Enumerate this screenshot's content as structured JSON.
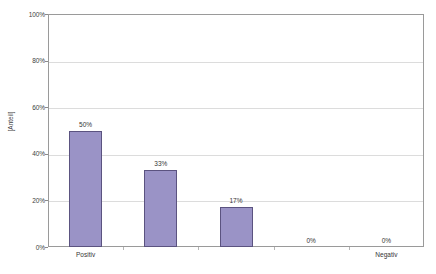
{
  "chart_data": {
    "type": "bar",
    "title": "",
    "subtitle": "",
    "xlabel": "",
    "ylabel": "[Anteil]",
    "ylim": [
      0,
      100
    ],
    "grid": true,
    "legend": false,
    "legend_position": "none",
    "categories": [
      "Positiv",
      "",
      "",
      "",
      "Negativ"
    ],
    "x_tick_labels": [
      "Positiv",
      "Negativ"
    ],
    "values": [
      50,
      33,
      17,
      0,
      0
    ],
    "data_labels": [
      "50%",
      "33%",
      "17%",
      "0%",
      "0%"
    ],
    "y_tick_labels": [
      "100%",
      "80%",
      "60%",
      "40%",
      "20%",
      "0%"
    ],
    "y_tick_values": [
      100,
      80,
      60,
      40,
      20,
      0
    ],
    "series": [
      {
        "name": "Anteil",
        "values": [
          50,
          33,
          17,
          0,
          0
        ]
      }
    ],
    "colors": {
      "bar_fill": "#9a93c6",
      "bar_border": "#5b5380",
      "gridline": "#dcdcdc",
      "axis": "#9a9a9a",
      "plot_background": "#ffffff",
      "text": "#353535"
    }
  }
}
